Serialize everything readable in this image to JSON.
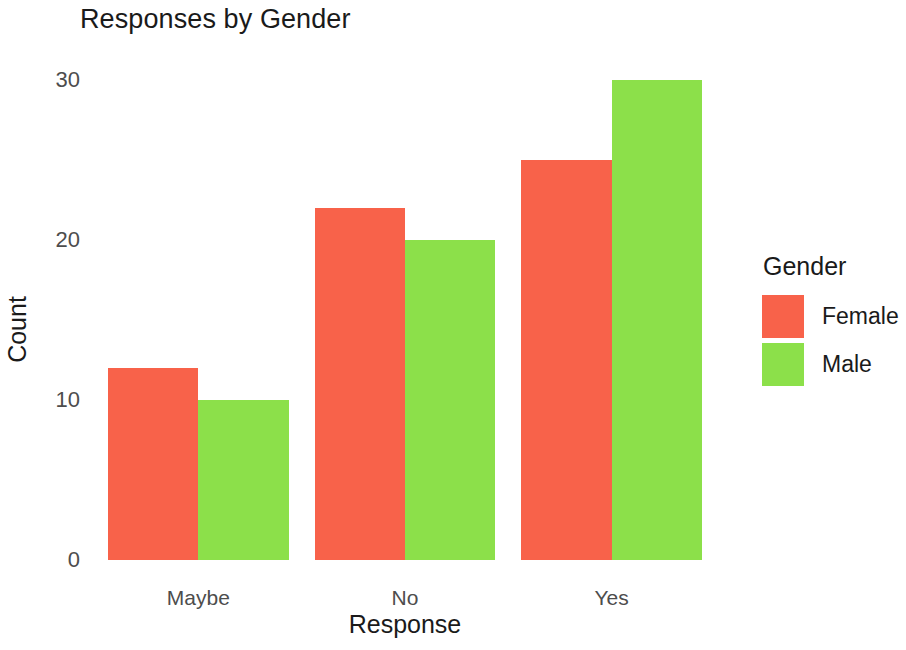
{
  "chart_data": {
    "type": "bar",
    "title": "Responses by Gender",
    "xlabel": "Response",
    "ylabel": "Count",
    "categories": [
      "Maybe",
      "No",
      "Yes"
    ],
    "series": [
      {
        "name": "Female",
        "color": "#F8624A",
        "values": [
          12,
          22,
          25
        ]
      },
      {
        "name": "Male",
        "color": "#8CE04A",
        "values": [
          10,
          20,
          30
        ]
      }
    ],
    "legend": {
      "title": "Gender",
      "position": "right",
      "entries": [
        {
          "label": "Female",
          "color": "#F8624A"
        },
        {
          "label": "Male",
          "color": "#8CE04A"
        }
      ]
    },
    "yticks": [
      0,
      10,
      20,
      30
    ],
    "ytick_labels": [
      "0",
      "10",
      "20",
      "30"
    ],
    "ylim": [
      0,
      30.6
    ],
    "grid": false,
    "dodge": "grouped"
  }
}
